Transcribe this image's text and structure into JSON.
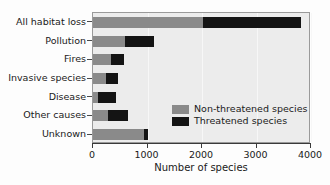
{
  "chart_data": {
    "type": "bar",
    "orientation": "horizontal",
    "stacked": true,
    "title": "",
    "xlabel": "Number of species",
    "ylabel": "",
    "xlim": [
      0,
      4000
    ],
    "ylim": null,
    "grid": true,
    "legend_position": "inside-bottom-right",
    "xticks": [
      0,
      1000,
      2000,
      3000,
      4000
    ],
    "xticklabels": [
      "0",
      "1000",
      "2000",
      "3000",
      "4000"
    ],
    "categories": [
      "All habitat loss",
      "Pollution",
      "Fires",
      "Invasive species",
      "Disease",
      "Other causes",
      "Unknown"
    ],
    "series": [
      {
        "name": "Non-threatened species",
        "color": "#8a8a8a",
        "values": [
          2020,
          580,
          330,
          240,
          100,
          280,
          940
        ]
      },
      {
        "name": "Threatened species",
        "color": "#141414",
        "values": [
          1790,
          540,
          230,
          210,
          320,
          370,
          70
        ]
      }
    ],
    "totals": [
      3810,
      1120,
      560,
      450,
      420,
      650,
      1010
    ]
  },
  "legend": {
    "entries": [
      {
        "label": "Non-threatened species",
        "swatch": "nonthreatened-swatch"
      },
      {
        "label": "Threatened species",
        "swatch": "threatened-swatch"
      }
    ]
  },
  "colors": {
    "nonthreatened": "#8a8a8a",
    "threatened": "#141414",
    "plot_background": "#ececec",
    "frame": "#9a9a9a",
    "text": "#1a1a1a"
  }
}
